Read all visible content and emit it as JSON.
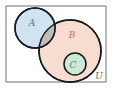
{
  "figure": {
    "type": "venn-diagram",
    "background_color": "#fefefe"
  },
  "universe": {
    "label": "U",
    "label_color": "#5a5a5a",
    "border_color": "#9a9a9a",
    "fill_color": "#ffffff",
    "x": 6,
    "y": 6,
    "width": 100,
    "height": 76
  },
  "sets": [
    {
      "id": "A",
      "label": "A",
      "label_color": "#4a6f96",
      "fill_color": "#cfe4f0",
      "stroke_color": "#1a1a2e",
      "cx": 35,
      "cy": 28,
      "r": 20,
      "label_x": 32,
      "label_y": 26
    },
    {
      "id": "B",
      "label": "B",
      "label_color": "#d4705c",
      "fill_color": "#f6ddcf",
      "stroke_color": "#1a1a1a",
      "cx": 70,
      "cy": 51,
      "r": 31,
      "label_x": 72,
      "label_y": 38
    },
    {
      "id": "C",
      "label": "C",
      "label_color": "#4e8b62",
      "fill_color": "#cfe7d6",
      "stroke_color": "#1a1a1a",
      "cx": 75,
      "cy": 64,
      "r": 11,
      "label_x": 73,
      "label_y": 68
    }
  ],
  "overlap": {
    "id": "A-intersect-B",
    "fill_color": "#bfb5ac",
    "opacity": 0.85
  }
}
